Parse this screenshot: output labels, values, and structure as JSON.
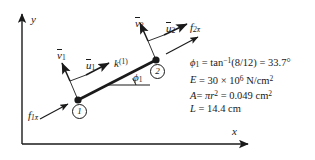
{
  "figure": {
    "type": "free-body-diagram",
    "background_color": "#ffffff",
    "line_color": "#1a1a1a"
  },
  "axes": {
    "x_label": "x",
    "y_label": "y",
    "origin_px": [
      22,
      144
    ],
    "x_end_px": [
      250,
      144
    ],
    "y_end_px": [
      22,
      12
    ]
  },
  "nodes": [
    {
      "id": "1",
      "label": "1",
      "px": [
        78,
        100
      ]
    },
    {
      "id": "2",
      "label": "2",
      "px": [
        155,
        60
      ]
    }
  ],
  "element": {
    "stiffness_label_base": "k",
    "stiffness_label_sup": "(1)",
    "angle_label_base": "ϕ",
    "angle_label_sub": "1"
  },
  "vectors": [
    {
      "name": "v1-bar",
      "base": "v",
      "overbar": true,
      "sub": "1",
      "direction": "up-left perpendicular to bar",
      "label_px": [
        64,
        56
      ]
    },
    {
      "name": "u1-bar",
      "base": "u",
      "overbar": true,
      "sub": "1",
      "direction": "up-right along bar",
      "label_px": [
        92,
        65
      ]
    },
    {
      "name": "v2-bar",
      "base": "v",
      "overbar": true,
      "sub": "2",
      "direction": "up-left perpendicular to bar",
      "label_px": [
        142,
        24
      ]
    },
    {
      "name": "u2-bar",
      "base": "u",
      "overbar": true,
      "sub": "2",
      "direction": "up-right along bar",
      "label_px": [
        171,
        29
      ]
    },
    {
      "name": "f1-xbar",
      "base": "f",
      "overbar": false,
      "sub": "1x̄",
      "direction": "up-right along bar toward node 1",
      "label_px": [
        30,
        113
      ]
    },
    {
      "name": "f2-xbar",
      "base": "f",
      "overbar": false,
      "sub": "2x̄",
      "direction": "up-right along bar away from node 2",
      "label_px": [
        190,
        27
      ]
    }
  ],
  "spec_lines": [
    {
      "id": "phi",
      "parts": [
        "ϕ",
        "1",
        " = tan",
        "−1",
        "(8/12) = 33.7°"
      ]
    },
    {
      "id": "E",
      "text": "E = 30 × 10⁶ N/cm²"
    },
    {
      "id": "A",
      "text": "A= πr² = 0.049 cm²"
    },
    {
      "id": "L",
      "text": "L = 14.4 cm"
    }
  ],
  "spec_values": {
    "phi_1_deg": "33.7",
    "phi_1_expr": "tan−1(8/12)",
    "E": "30 × 10⁶ N/cm²",
    "A": "πr² = 0.049 cm²",
    "L": "14.4 cm"
  }
}
